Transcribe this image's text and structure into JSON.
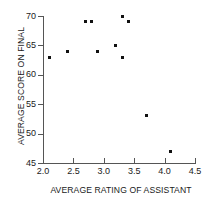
{
  "chart_data": {
    "type": "scatter",
    "title": "",
    "xlabel": "AVERAGE RATING OF ASSISTANT",
    "ylabel": "AVERAGE SCORE ON FINAL",
    "xlim": [
      2.0,
      4.5
    ],
    "ylim": [
      45,
      70
    ],
    "xticks": [
      "2.0",
      "2.5",
      "3.0",
      "3.5",
      "4.0",
      "4.5"
    ],
    "xtick_values": [
      2.0,
      2.5,
      3.0,
      3.5,
      4.0,
      4.5
    ],
    "yticks": [
      "45",
      "50",
      "55",
      "60",
      "65",
      "70"
    ],
    "ytick_values": [
      45,
      50,
      55,
      60,
      65,
      70
    ],
    "grid": false,
    "legend": false,
    "marker": "square",
    "marker_color": "#111111",
    "axis_color": "#555555",
    "x": [
      2.1,
      2.4,
      2.7,
      2.8,
      2.9,
      3.2,
      3.3,
      3.3,
      3.4,
      3.7,
      4.1
    ],
    "y": [
      63,
      64,
      69,
      69,
      64,
      65,
      70,
      63,
      69,
      53,
      47
    ],
    "points": [
      {
        "x": 2.1,
        "y": 63
      },
      {
        "x": 2.4,
        "y": 64
      },
      {
        "x": 2.7,
        "y": 69
      },
      {
        "x": 2.8,
        "y": 69
      },
      {
        "x": 2.9,
        "y": 64
      },
      {
        "x": 3.2,
        "y": 65
      },
      {
        "x": 3.3,
        "y": 70
      },
      {
        "x": 3.3,
        "y": 63
      },
      {
        "x": 3.4,
        "y": 69
      },
      {
        "x": 3.7,
        "y": 53
      },
      {
        "x": 4.1,
        "y": 47
      }
    ]
  }
}
